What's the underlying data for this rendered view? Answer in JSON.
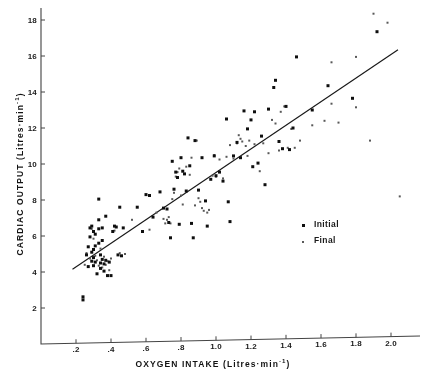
{
  "chart_data": {
    "type": "scatter",
    "title": "",
    "xlabel": "OXYGEN INTAKE (Litres·min",
    "xlabel_exp": "-1",
    "xlabel_tail": ")",
    "ylabel": "CARDIAC OUTPUT (Litres·min",
    "ylabel_exp": "-1",
    "ylabel_tail": ")",
    "xlabel_full": "OXYGEN INTAKE (Litres·min-1)",
    "ylabel_full": "CARDIAC OUTPUT (Litres·min-1)",
    "xlim": [
      0.0,
      2.15
    ],
    "ylim": [
      0.0,
      18.9
    ],
    "xticks": [
      0.2,
      0.4,
      0.6,
      0.8,
      1.0,
      1.2,
      1.4,
      1.6,
      1.8,
      2.0
    ],
    "xticklabels": [
      ".2",
      ".4",
      ".6",
      ".8",
      "1.0",
      "1.2",
      "1.4",
      "1.6",
      "1.8",
      "2.0"
    ],
    "yticks": [
      2,
      4,
      6,
      8,
      10,
      12,
      14,
      16,
      18
    ],
    "yticklabels": [
      "2",
      "4",
      "6",
      "8",
      "10",
      "12",
      "14",
      "16",
      "18"
    ],
    "grid": false,
    "legend_position": "center-right",
    "marker_colors": {
      "initial": "#111111",
      "final": "#595959"
    },
    "trend_line": {
      "label": "regression line",
      "x_start": 0.18,
      "y_start": 4.15,
      "x_end": 2.04,
      "y_end": 16.35
    },
    "series": [
      {
        "name": "Initial",
        "marker": "square",
        "marker_size": 3,
        "points": [
          [
            0.24,
            2.62
          ],
          [
            0.24,
            2.45
          ],
          [
            0.26,
            4.95
          ],
          [
            0.27,
            4.3
          ],
          [
            0.27,
            5.4
          ],
          [
            0.28,
            6.45
          ],
          [
            0.28,
            5.95
          ],
          [
            0.29,
            6.55
          ],
          [
            0.29,
            5.1
          ],
          [
            0.29,
            4.6
          ],
          [
            0.3,
            6.25
          ],
          [
            0.3,
            5.25
          ],
          [
            0.3,
            4.8
          ],
          [
            0.3,
            4.35
          ],
          [
            0.31,
            6.1
          ],
          [
            0.31,
            5.45
          ],
          [
            0.31,
            4.55
          ],
          [
            0.32,
            3.9
          ],
          [
            0.33,
            8.05
          ],
          [
            0.33,
            6.9
          ],
          [
            0.33,
            6.4
          ],
          [
            0.33,
            5.6
          ],
          [
            0.34,
            4.95
          ],
          [
            0.34,
            4.5
          ],
          [
            0.34,
            4.2
          ],
          [
            0.35,
            6.45
          ],
          [
            0.35,
            5.75
          ],
          [
            0.35,
            4.7
          ],
          [
            0.36,
            4.45
          ],
          [
            0.36,
            4.05
          ],
          [
            0.37,
            7.1
          ],
          [
            0.37,
            4.65
          ],
          [
            0.38,
            3.8
          ],
          [
            0.39,
            4.55
          ],
          [
            0.4,
            3.8
          ],
          [
            0.41,
            6.25
          ],
          [
            0.42,
            6.55
          ],
          [
            0.43,
            6.5
          ],
          [
            0.44,
            4.95
          ],
          [
            0.45,
            7.6
          ],
          [
            0.46,
            4.9
          ],
          [
            0.47,
            6.45
          ],
          [
            0.55,
            7.6
          ],
          [
            0.58,
            6.25
          ],
          [
            0.6,
            8.3
          ],
          [
            0.62,
            8.25
          ],
          [
            0.64,
            7.05
          ],
          [
            0.68,
            8.45
          ],
          [
            0.7,
            7.55
          ],
          [
            0.72,
            7.5
          ],
          [
            0.73,
            6.75
          ],
          [
            0.74,
            5.9
          ],
          [
            0.75,
            10.15
          ],
          [
            0.76,
            8.6
          ],
          [
            0.77,
            9.55
          ],
          [
            0.78,
            9.25
          ],
          [
            0.79,
            6.65
          ],
          [
            0.8,
            10.35
          ],
          [
            0.81,
            9.6
          ],
          [
            0.82,
            9.45
          ],
          [
            0.83,
            8.5
          ],
          [
            0.84,
            11.45
          ],
          [
            0.85,
            9.9
          ],
          [
            0.86,
            6.7
          ],
          [
            0.87,
            5.9
          ],
          [
            0.88,
            11.3
          ],
          [
            0.9,
            8.55
          ],
          [
            0.92,
            10.35
          ],
          [
            0.94,
            7.95
          ],
          [
            0.95,
            6.55
          ],
          [
            0.97,
            9.15
          ],
          [
            0.99,
            10.45
          ],
          [
            1.0,
            9.35
          ],
          [
            1.02,
            9.55
          ],
          [
            1.04,
            9.05
          ],
          [
            1.06,
            12.5
          ],
          [
            1.07,
            7.9
          ],
          [
            1.08,
            6.8
          ],
          [
            1.1,
            10.45
          ],
          [
            1.12,
            11.2
          ],
          [
            1.14,
            10.35
          ],
          [
            1.16,
            12.95
          ],
          [
            1.18,
            11.95
          ],
          [
            1.2,
            12.45
          ],
          [
            1.21,
            9.85
          ],
          [
            1.22,
            12.9
          ],
          [
            1.24,
            10.05
          ],
          [
            1.26,
            11.55
          ],
          [
            1.28,
            8.85
          ],
          [
            1.3,
            13.05
          ],
          [
            1.33,
            14.25
          ],
          [
            1.34,
            14.65
          ],
          [
            1.36,
            11.25
          ],
          [
            1.38,
            10.85
          ],
          [
            1.4,
            13.2
          ],
          [
            1.42,
            10.8
          ],
          [
            1.44,
            12.0
          ],
          [
            1.46,
            15.95
          ],
          [
            1.55,
            13.0
          ],
          [
            1.64,
            14.35
          ],
          [
            1.78,
            13.65
          ],
          [
            1.92,
            17.35
          ]
        ]
      },
      {
        "name": "Final",
        "marker": "square",
        "marker_size": 2,
        "points": [
          [
            0.25,
            4.4
          ],
          [
            0.26,
            5.05
          ],
          [
            0.28,
            4.75
          ],
          [
            0.29,
            6.4
          ],
          [
            0.3,
            5.85
          ],
          [
            0.31,
            4.9
          ],
          [
            0.32,
            4.65
          ],
          [
            0.33,
            4.35
          ],
          [
            0.34,
            5.3
          ],
          [
            0.35,
            4.25
          ],
          [
            0.36,
            4.85
          ],
          [
            0.37,
            4.4
          ],
          [
            0.38,
            4.6
          ],
          [
            0.39,
            4.1
          ],
          [
            0.4,
            4.75
          ],
          [
            0.42,
            6.3
          ],
          [
            0.45,
            5.05
          ],
          [
            0.48,
            5.0
          ],
          [
            0.52,
            6.9
          ],
          [
            0.62,
            6.35
          ],
          [
            0.66,
            7.3
          ],
          [
            0.7,
            6.95
          ],
          [
            0.71,
            6.7
          ],
          [
            0.72,
            6.9
          ],
          [
            0.73,
            7.05
          ],
          [
            0.74,
            6.7
          ],
          [
            0.75,
            8.05
          ],
          [
            0.76,
            8.4
          ],
          [
            0.77,
            9.3
          ],
          [
            0.78,
            9.55
          ],
          [
            0.79,
            9.75
          ],
          [
            0.8,
            8.25
          ],
          [
            0.81,
            7.75
          ],
          [
            0.83,
            9.85
          ],
          [
            0.85,
            9.4
          ],
          [
            0.86,
            10.35
          ],
          [
            0.88,
            7.7
          ],
          [
            0.9,
            8.1
          ],
          [
            0.91,
            7.9
          ],
          [
            0.92,
            7.55
          ],
          [
            0.93,
            7.4
          ],
          [
            0.95,
            7.3
          ],
          [
            0.96,
            7.45
          ],
          [
            0.98,
            9.35
          ],
          [
            1.0,
            9.3
          ],
          [
            1.02,
            10.25
          ],
          [
            1.04,
            9.2
          ],
          [
            1.06,
            10.4
          ],
          [
            1.08,
            11.05
          ],
          [
            1.1,
            10.3
          ],
          [
            1.12,
            11.15
          ],
          [
            1.13,
            11.6
          ],
          [
            1.15,
            11.25
          ],
          [
            1.17,
            11.0
          ],
          [
            1.19,
            11.3
          ],
          [
            1.22,
            11.1
          ],
          [
            1.25,
            9.6
          ],
          [
            1.27,
            11.15
          ],
          [
            1.3,
            10.6
          ],
          [
            1.32,
            12.45
          ],
          [
            1.34,
            12.25
          ],
          [
            1.36,
            10.75
          ],
          [
            1.37,
            12.9
          ],
          [
            1.39,
            13.2
          ],
          [
            1.41,
            10.9
          ],
          [
            1.43,
            11.95
          ],
          [
            1.45,
            10.9
          ],
          [
            1.48,
            11.3
          ],
          [
            1.55,
            12.15
          ],
          [
            1.62,
            12.4
          ],
          [
            1.66,
            13.35
          ],
          [
            1.7,
            12.3
          ],
          [
            1.8,
            13.15
          ],
          [
            1.8,
            15.95
          ],
          [
            1.66,
            15.65
          ],
          [
            1.88,
            11.3
          ],
          [
            1.9,
            18.35
          ],
          [
            1.98,
            17.85
          ],
          [
            2.05,
            8.2
          ],
          [
            1.14,
            11.4
          ],
          [
            1.18,
            10.45
          ],
          [
            0.99,
            10.5
          ],
          [
            0.89,
            11.3
          ]
        ]
      }
    ],
    "legend": [
      {
        "label": "Initial",
        "marker": "large-square"
      },
      {
        "label": "Final",
        "marker": "small-square"
      }
    ]
  }
}
